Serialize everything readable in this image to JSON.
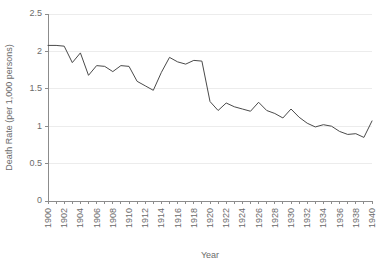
{
  "chart_data": {
    "type": "line",
    "title": "",
    "xlabel": "Year",
    "ylabel": "Death Rate (per 1,000 persons)",
    "xlim": [
      1900,
      1940
    ],
    "ylim": [
      0,
      2.5
    ],
    "grid": true,
    "legend": false,
    "legend_position": "none",
    "line_color": "#4a4a4a",
    "x": [
      1900,
      1901,
      1902,
      1903,
      1904,
      1905,
      1906,
      1907,
      1908,
      1909,
      1910,
      1911,
      1912,
      1913,
      1914,
      1915,
      1916,
      1917,
      1918,
      1919,
      1920,
      1921,
      1922,
      1923,
      1924,
      1925,
      1926,
      1927,
      1928,
      1929,
      1930,
      1931,
      1932,
      1933,
      1934,
      1935,
      1936,
      1937,
      1938,
      1939,
      1940
    ],
    "values": [
      2.08,
      2.08,
      2.07,
      1.85,
      1.98,
      1.68,
      1.81,
      1.8,
      1.73,
      1.81,
      1.8,
      1.6,
      1.54,
      1.48,
      1.72,
      1.92,
      1.86,
      1.83,
      1.88,
      1.87,
      1.33,
      1.21,
      1.31,
      1.26,
      1.23,
      1.2,
      1.32,
      1.21,
      1.17,
      1.11,
      1.23,
      1.12,
      1.04,
      0.99,
      1.02,
      1.0,
      0.93,
      0.89,
      0.9,
      0.85,
      1.07
    ],
    "series": [
      {
        "name": "Death Rate",
        "values": [
          2.08,
          2.08,
          2.07,
          1.85,
          1.98,
          1.68,
          1.81,
          1.8,
          1.73,
          1.81,
          1.8,
          1.6,
          1.54,
          1.48,
          1.72,
          1.92,
          1.86,
          1.83,
          1.88,
          1.87,
          1.33,
          1.21,
          1.31,
          1.26,
          1.23,
          1.2,
          1.32,
          1.21,
          1.17,
          1.11,
          1.23,
          1.12,
          1.04,
          0.99,
          1.02,
          1.0,
          0.93,
          0.89,
          0.9,
          0.85,
          1.07
        ]
      }
    ],
    "yticks": [
      0,
      0.5,
      1,
      1.5,
      2,
      2.5
    ],
    "ytick_labels": [
      "0",
      "0.5",
      "1",
      "1.5",
      "2",
      "2.5"
    ],
    "xticks": [
      1900,
      1901,
      1902,
      1903,
      1904,
      1905,
      1906,
      1907,
      1908,
      1909,
      1910,
      1911,
      1912,
      1913,
      1914,
      1915,
      1916,
      1917,
      1918,
      1919,
      1920,
      1921,
      1922,
      1923,
      1924,
      1925,
      1926,
      1927,
      1928,
      1929,
      1930,
      1931,
      1932,
      1933,
      1934,
      1935,
      1936,
      1937,
      1938,
      1939,
      1940
    ],
    "xtick_labels": [
      "1900",
      "",
      "1902",
      "",
      "1904",
      "",
      "1906",
      "",
      "1908",
      "",
      "1910",
      "",
      "1912",
      "",
      "1914",
      "",
      "1916",
      "",
      "1918",
      "",
      "1920",
      "",
      "1922",
      "",
      "1924",
      "",
      "1926",
      "",
      "1928",
      "",
      "1930",
      "",
      "1932",
      "",
      "1934",
      "",
      "1936",
      "",
      "1938",
      "",
      "1940"
    ]
  }
}
